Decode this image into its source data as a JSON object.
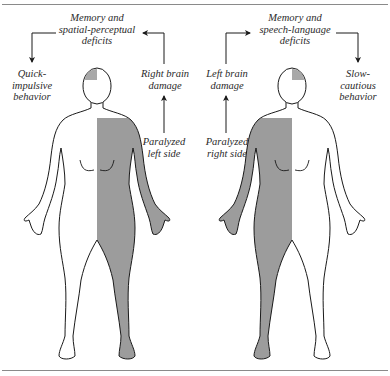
{
  "colors": {
    "paralyzed_fill": "#9c9c9c",
    "outline": "#1a1a1a",
    "rule": "#8a8a8a",
    "text": "#2a2a2a"
  },
  "left_panel": {
    "deficits_label": [
      "Memory and",
      "spatial-perceptual",
      "deficits"
    ],
    "behavior_label": [
      "Quick-",
      "impulsive",
      "behavior"
    ],
    "damage_label": [
      "Right brain",
      "damage"
    ],
    "paralysis_label": [
      "Paralyzed",
      "left side"
    ],
    "paralyzed_side": "left"
  },
  "right_panel": {
    "deficits_label": [
      "Memory and",
      "speech-language",
      "deficits"
    ],
    "behavior_label": [
      "Slow-",
      "cautious",
      "behavior"
    ],
    "damage_label": [
      "Left brain",
      "damage"
    ],
    "paralysis_label": [
      "Paralyzed",
      "right side"
    ],
    "paralyzed_side": "right"
  }
}
